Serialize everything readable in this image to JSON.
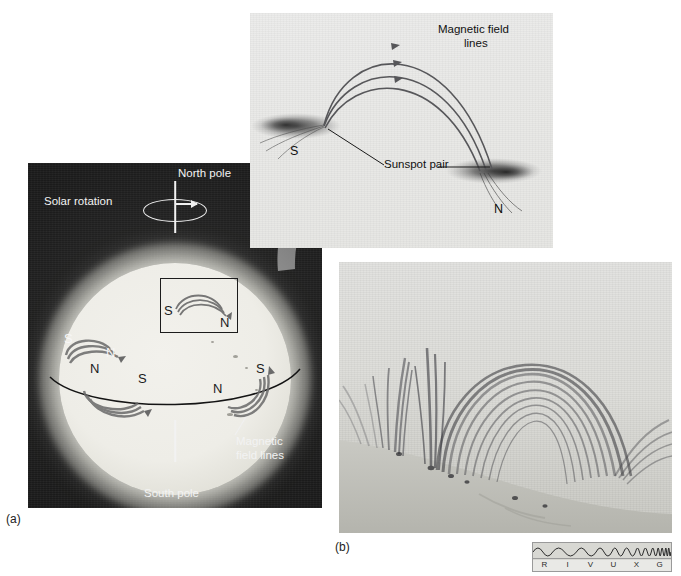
{
  "figure": {
    "domain": "scientific-illustration"
  },
  "panel_a": {
    "tag": "(a)",
    "labels": {
      "north_pole": "North pole",
      "south_pole": "South pole",
      "solar_rotation": "Solar rotation",
      "magnetic_field_lines": "Magnetic\nfield lines",
      "magnetic_field_lines_line1": "Magnetic",
      "magnetic_field_lines_line2": "field lines"
    },
    "polarity_marks": [
      {
        "label": "S",
        "region": "northern-hemisphere-left-leading"
      },
      {
        "label": "N",
        "region": "northern-hemisphere-left-trailing"
      },
      {
        "label": "S",
        "region": "callout-box-left"
      },
      {
        "label": "N",
        "region": "callout-box-right"
      },
      {
        "label": "N",
        "region": "southern-hemisphere-left-leading"
      },
      {
        "label": "S",
        "region": "southern-hemisphere-left-trailing"
      },
      {
        "label": "N",
        "region": "southern-hemisphere-right-leading"
      },
      {
        "label": "S",
        "region": "southern-hemisphere-right-trailing"
      }
    ],
    "callout_box_note": "rectangle enclosing a sunspot pair, magnified by the curved arrow into the inset"
  },
  "panel_inset": {
    "labels": {
      "magnetic_field_lines_line1": "Magnetic field",
      "magnetic_field_lines_line2": "lines",
      "sunspot_pair": "Sunspot pair",
      "pole_s": "S",
      "pole_n": "N"
    },
    "field_line_count": 3,
    "arrow_direction": "from S spot to N spot"
  },
  "panel_b": {
    "tag": "(b)",
    "description": "X-ray/EUV image of coronal loops arching above the solar limb"
  },
  "spectrum_bar": {
    "bands": [
      "R",
      "I",
      "V",
      "U",
      "X",
      "G"
    ],
    "highlighted_band": "X",
    "meaning": [
      "Radio",
      "Infrared",
      "Visible",
      "Ultraviolet",
      "X-ray",
      "Gamma ray"
    ]
  },
  "colors": {
    "panel_a_background": "#1b1b1b",
    "sun_disc": "#f0efe9",
    "label_light": "#f3f3f3",
    "label_dark": "#111111",
    "arrow_gray": "#6f6f6f",
    "field_line": "#5e5e5e",
    "spectrum_bg": "#e9e9e6"
  }
}
